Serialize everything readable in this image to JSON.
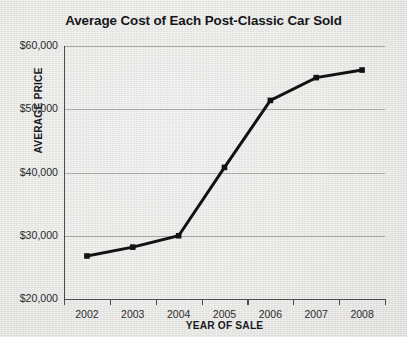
{
  "chart_data": {
    "type": "line",
    "title": "Average Cost of Each Post-Classic Car Sold",
    "xlabel": "YEAR OF SALE",
    "ylabel": "AVERAGE PRICE",
    "categories": [
      "2002",
      "2003",
      "2004",
      "2005",
      "2006",
      "2007",
      "2008"
    ],
    "values": [
      26800,
      28200,
      30000,
      40800,
      51400,
      55000,
      56200
    ],
    "series": [
      {
        "name": "Average price",
        "values": [
          26800,
          28200,
          30000,
          40800,
          51400,
          55000,
          56200
        ]
      }
    ],
    "ylim": [
      20000,
      60000
    ],
    "ytick_values": [
      60000,
      50000,
      40000,
      30000,
      20000
    ],
    "ytick_labels": [
      "$60,000",
      "$50,000",
      "$40,000",
      "$30,000",
      "$20,000"
    ],
    "xtick_labels": [
      "2002",
      "2003",
      "2004",
      "2005",
      "2006",
      "2007",
      "2008"
    ],
    "grid": true,
    "legend": "none",
    "line_color": "#121212",
    "marker": "square",
    "grid_color": "#a9a9a8",
    "axis_color": "#4b4b4d",
    "background_color": "#e9e9e7"
  }
}
